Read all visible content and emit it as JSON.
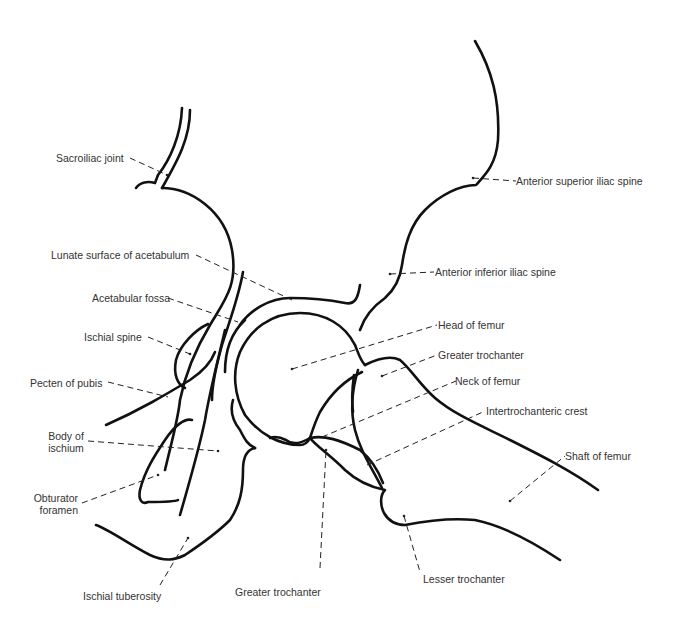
{
  "diagram": {
    "colors": {
      "line": "#111111",
      "text": "#333333",
      "background": "#ffffff"
    }
  },
  "labels": {
    "sacroiliac_joint": "Sacroiliac joint",
    "lunate_surface": "Lunate surface of acetabulum",
    "acetabular_fossa": "Acetabular fossa",
    "ischial_spine": "Ischial spine",
    "pecten_of_pubis": "Pecten of pubis",
    "body_of_ischium_1": "Body of",
    "body_of_ischium_2": "ischium",
    "obturator_foramen_1": "Obturator",
    "obturator_foramen_2": "foramen",
    "ischial_tuberosity": "Ischial tuberosity",
    "greater_trochanter_bottom": "Greater trochanter",
    "anterior_superior_iliac_spine": "Anterior superior iliac spine",
    "anterior_inferior_iliac_spine": "Anterior inferior iliac spine",
    "head_of_femur": "Head of femur",
    "greater_trochanter_top": "Greater trochanter",
    "neck_of_femur": "Neck of femur",
    "intertrochanteric_crest": "Intertrochanteric crest",
    "shaft_of_femur": "Shaft of femur",
    "lesser_trochanter": "Lesser trochanter"
  }
}
